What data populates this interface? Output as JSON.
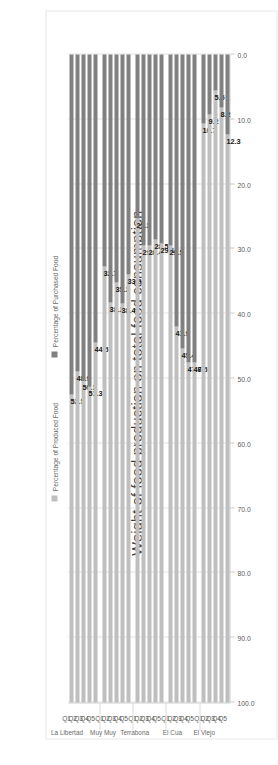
{
  "chart_data": {
    "type": "bar",
    "orientation": "horizontal-stacked",
    "title": "Weight of food production on total food consumption",
    "xlabel": "",
    "ylabel": "",
    "xlim": [
      0,
      100
    ],
    "grid": true,
    "legend_position": "bottom",
    "tick_labels": [
      "0.0",
      "10.0",
      "20.0",
      "30.0",
      "40.0",
      "50.0",
      "60.0",
      "70.0",
      "80.0",
      "90.0",
      "100.0"
    ],
    "tick_values": [
      0,
      10,
      20,
      30,
      40,
      50,
      60,
      70,
      80,
      90,
      100
    ],
    "series": [
      {
        "name": "Percentage of Produced Food",
        "color": "#bfbfbf"
      },
      {
        "name": "Percentage of Purchased Food",
        "color": "#808080"
      }
    ],
    "groups": [
      {
        "name": "La Libertad",
        "categories": [
          "Q1",
          "Q2",
          "Q3",
          "Q4",
          "Q5"
        ],
        "produced": [
          52.5,
          48.9,
          50.3,
          51.3,
          44.5
        ],
        "purchased": [
          47.5,
          51.1,
          49.7,
          48.7,
          55.5
        ],
        "labels": [
          "52.5",
          "48.9",
          "50.3",
          "51.3",
          "44.5"
        ]
      },
      {
        "name": "Muy Muy",
        "categories": [
          "Q1",
          "Q2",
          "Q3",
          "Q4",
          "Q5"
        ],
        "produced": [
          32.7,
          38.2,
          35.2,
          38.4,
          33.9
        ],
        "purchased": [
          67.3,
          61.8,
          64.8,
          61.6,
          66.1
        ],
        "labels": [
          "32.7",
          "38.2",
          "35.2",
          "38.4",
          "33.9"
        ]
      },
      {
        "name": "Terrabona",
        "categories": [
          "Q1",
          "Q2",
          "Q3",
          "Q4",
          "Q5"
        ],
        "produced": [
          25.3,
          29.4,
          29.4,
          28.5,
          29.1
        ],
        "purchased": [
          74.7,
          70.6,
          70.6,
          71.5,
          70.9
        ],
        "labels": [
          "25.3",
          "29.4",
          "29.4",
          "28.5",
          "29.1"
        ]
      },
      {
        "name": "El Cua",
        "categories": [
          "Q1",
          "Q2",
          "Q3",
          "Q4",
          "Q5"
        ],
        "produced": [
          29.5,
          41.9,
          45.4,
          47.6,
          47.5
        ],
        "purchased": [
          70.5,
          58.1,
          54.6,
          52.4,
          52.5
        ],
        "labels": [
          "29.5",
          "41.9",
          "45.4",
          "47.6",
          "47.5"
        ]
      },
      {
        "name": "El Viejo",
        "categories": [
          "Q1",
          "Q2",
          "Q3",
          "Q4",
          "Q5"
        ],
        "produced": [
          10.7,
          9.2,
          5.5,
          8.2,
          12.3
        ],
        "purchased": [
          89.3,
          90.8,
          94.5,
          91.8,
          87.7
        ],
        "labels": [
          "10.7",
          "9.2",
          "5.5",
          "8.2",
          "12.3"
        ]
      }
    ]
  },
  "colors": {
    "produced": "#bfbfbf",
    "purchased": "#808080",
    "grid": "#e4e4e4",
    "text": "#5a5a5a",
    "title": "#3f3f3f"
  }
}
